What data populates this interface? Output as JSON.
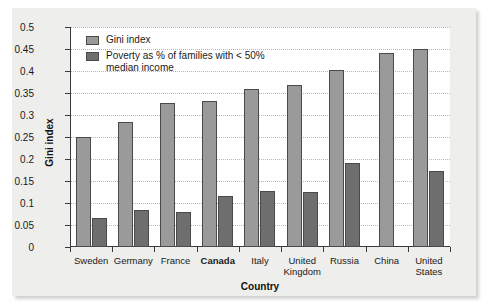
{
  "chart_data": {
    "type": "bar",
    "title": "",
    "xlabel": "Country",
    "ylabel": "Gini index",
    "ylim": [
      0,
      0.5
    ],
    "ytick_labels": [
      "0",
      "0.05",
      "0.1",
      "0.15",
      "0.2",
      "0.25",
      "0.3",
      "0.35",
      "0.4",
      "0.45",
      "0.5"
    ],
    "ytick_values": [
      0,
      0.05,
      0.1,
      0.15,
      0.2,
      0.25,
      0.3,
      0.35,
      0.4,
      0.45,
      0.5
    ],
    "grid": true,
    "legend_position": "top-left",
    "highlighted_category": "Canada",
    "categories": [
      "Sweden",
      "Germany",
      "France",
      "Canada",
      "Italy",
      "United Kingdom",
      "Russia",
      "China",
      "United States"
    ],
    "series": [
      {
        "name": "Gini index",
        "color": "#9a9a9a",
        "values": [
          0.25,
          0.283,
          0.327,
          0.331,
          0.36,
          0.369,
          0.402,
          0.441,
          0.451
        ]
      },
      {
        "name": "Poverty as % of families with < 50% median income",
        "color": "#6e6e6e",
        "values": [
          0.065,
          0.085,
          0.08,
          0.115,
          0.128,
          0.126,
          0.191,
          null,
          0.172
        ]
      }
    ]
  },
  "legend": {
    "entries": [
      {
        "label": "Gini index",
        "swatch": "gini"
      },
      {
        "label": "Poverty as % of families with < 50%\nmedian income",
        "swatch": "pov"
      }
    ]
  }
}
